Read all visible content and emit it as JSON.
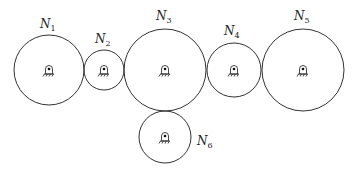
{
  "diagram": {
    "gears": [
      {
        "id": "N1",
        "label": "N",
        "sub": "1",
        "cx": 49,
        "cy": 70,
        "r": 35,
        "lx": 40,
        "ly": 28
      },
      {
        "id": "N2",
        "label": "N",
        "sub": "2",
        "cx": 104,
        "cy": 70,
        "r": 20,
        "lx": 95,
        "ly": 43
      },
      {
        "id": "N3",
        "label": "N",
        "sub": "3",
        "cx": 165,
        "cy": 70,
        "r": 41,
        "lx": 156,
        "ly": 20
      },
      {
        "id": "N4",
        "label": "N",
        "sub": "4",
        "cx": 234,
        "cy": 70,
        "r": 27,
        "lx": 224,
        "ly": 35
      },
      {
        "id": "N5",
        "label": "N",
        "sub": "5",
        "cx": 303,
        "cy": 70,
        "r": 41,
        "lx": 294,
        "ly": 20
      },
      {
        "id": "N6",
        "label": "N",
        "sub": "6",
        "cx": 165,
        "cy": 137,
        "r": 26,
        "lx": 197,
        "ly": 145
      }
    ]
  }
}
